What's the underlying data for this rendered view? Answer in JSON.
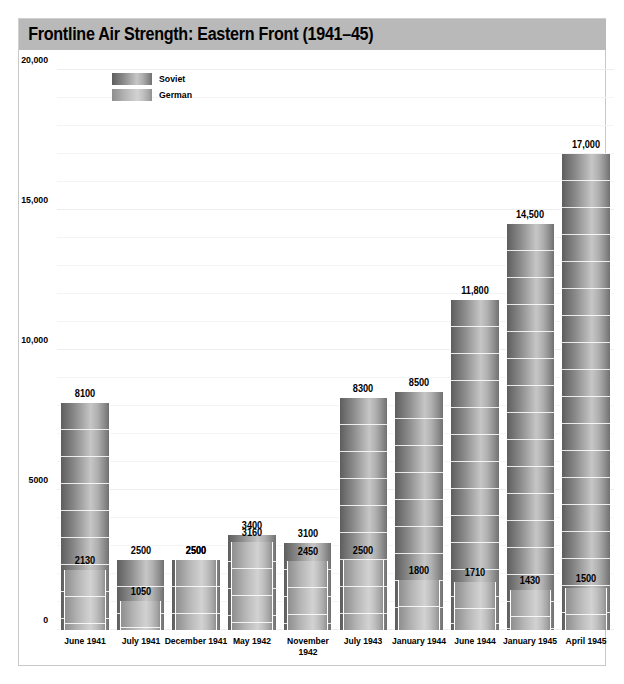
{
  "header": {
    "title": "Frontline Air Strength: Eastern Front (1941–45)",
    "background_color": "#b9b9b9"
  },
  "legend": {
    "position": "top-left-inside",
    "entries": [
      {
        "label": "Soviet",
        "color": "#8a8a8a"
      },
      {
        "label": "German",
        "color": "#c0c0c0"
      }
    ]
  },
  "axes": {
    "y_ticks": [
      "20,000",
      "15,000",
      "10,000",
      "5000",
      "0"
    ],
    "y_tick_values": [
      20000,
      15000,
      10000,
      5000,
      0
    ],
    "ylim": [
      0,
      20000
    ],
    "grid_interval": 1000
  },
  "chart_data": {
    "type": "bar",
    "title": "Frontline Air Strength: Eastern Front (1941–45)",
    "xlabel": "",
    "ylabel": "",
    "ylim": [
      0,
      20000
    ],
    "grid": true,
    "legend_position": "top-left-inside",
    "categories": [
      "June 1941",
      "July 1941",
      "December 1941",
      "May 1942",
      "November\n1942",
      "July 1943",
      "January 1944",
      "June 1944",
      "January 1945",
      "April 1945"
    ],
    "series": [
      {
        "name": "Soviet",
        "values": [
          8100,
          2500,
          2500,
          3400,
          3100,
          8300,
          8500,
          11800,
          14500,
          17000
        ],
        "labels": [
          "8100",
          "2500",
          "2500",
          "3400",
          "3100",
          "8300",
          "8500",
          "11,800",
          "14,500",
          "17,000"
        ]
      },
      {
        "name": "German",
        "values": [
          2130,
          1050,
          2500,
          3160,
          2450,
          2500,
          1800,
          1710,
          1430,
          1500
        ],
        "labels": [
          "2130",
          "1050",
          "2500",
          "3160",
          "2450",
          "2500",
          "1800",
          "1710",
          "1430",
          "1500"
        ]
      }
    ]
  }
}
